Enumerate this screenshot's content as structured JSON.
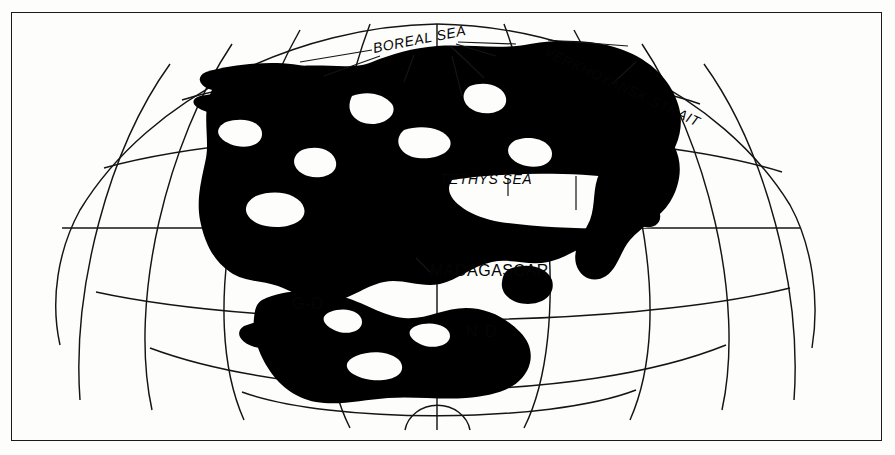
{
  "figure": {
    "kind": "paleogeographic-map",
    "projection": "globular / oval equal-area graticule",
    "border": true,
    "background_color": "#fdfdfc",
    "land_color": "#000000",
    "line_color": "#111111"
  },
  "labels": {
    "boreal_sea": "BOREAL SEA",
    "verkhoyansk_strait": "VERKHOYANSK STRAIT",
    "tethys_sea": "TETHYS SEA",
    "madagascar": "MADAGASCAR",
    "gondwana_left_fragment": "G-O",
    "gondwana_right_fragment": "N D"
  },
  "graticule": {
    "equator_y": 228,
    "parallels": 5,
    "meridians": 9,
    "pole_arc": true
  }
}
